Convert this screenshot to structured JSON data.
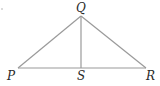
{
  "diagram": {
    "type": "triangle",
    "vertices": {
      "Q": {
        "label": "Q",
        "x": 81,
        "y": 16
      },
      "P": {
        "label": "P",
        "x": 18,
        "y": 68
      },
      "R": {
        "label": "R",
        "x": 146,
        "y": 68
      },
      "S": {
        "label": "S",
        "x": 81,
        "y": 68
      }
    },
    "segments": [
      "PQ",
      "QR",
      "PR",
      "QS"
    ],
    "line_color": "#9a9a9a",
    "label_color": "#2a2a2a"
  }
}
